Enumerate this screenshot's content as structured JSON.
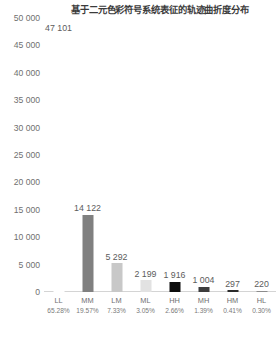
{
  "chart_data": {
    "type": "bar",
    "title": "基于二元色彩符号系统表征的轨迹曲折度分布",
    "xlabel": "",
    "ylabel": "",
    "ylim": [
      0,
      50000
    ],
    "ytick_step": 5000,
    "grid": false,
    "legend": "none",
    "categories": [
      "LL",
      "MM",
      "LM",
      "ML",
      "HH",
      "MH",
      "HM",
      "HL"
    ],
    "values": [
      47101,
      14122,
      5292,
      2199,
      1916,
      1004,
      297,
      220
    ],
    "value_labels": [
      "47 101",
      "14 122",
      "5 292",
      "2 199",
      "1 916",
      "1 004",
      "297",
      "220"
    ],
    "percent_labels": [
      "65.28%",
      "19.57%",
      "7.33%",
      "3.05%",
      "2.66%",
      "1.39%",
      "0.41%",
      "0.30%"
    ],
    "ytick_labels": [
      "50 000",
      "45 000",
      "40 000",
      "35 000",
      "30 000",
      "25 000",
      "20 000",
      "15 000",
      "10 000",
      "5 000",
      "0"
    ],
    "ytick_values": [
      50000,
      45000,
      40000,
      35000,
      30000,
      25000,
      20000,
      15000,
      10000,
      5000,
      0
    ],
    "bar_colors": [
      "#ffffff",
      "#808080",
      "#c8c8c8",
      "#e2e2e2",
      "#0d0d0d",
      "#3d3d3d",
      "#2b2b2b",
      "#8c8c8c"
    ]
  },
  "colors": {
    "background": "#ffffff",
    "title_text": "#3b3b3b",
    "tick_text": "#6f6f6f",
    "value_text": "#5c5c5c",
    "axis_line": "#d4d4d4"
  }
}
